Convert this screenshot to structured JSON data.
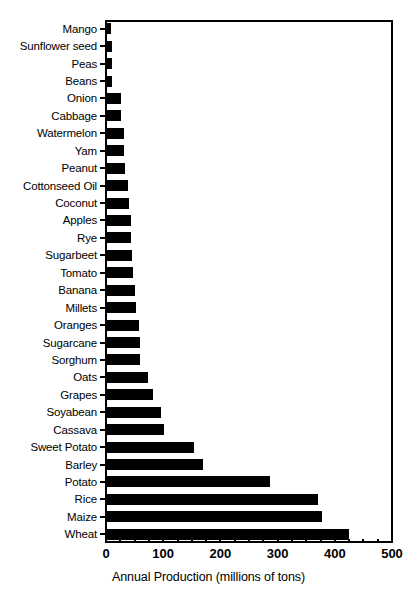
{
  "chart_data": {
    "type": "bar",
    "orientation": "horizontal",
    "title": "",
    "xlabel": "Annual Production (millions of tons)",
    "ylabel": "",
    "xlim": [
      0,
      500
    ],
    "xticks": [
      0,
      100,
      200,
      300,
      400,
      500
    ],
    "xtick_labels": [
      "0",
      "100",
      "200",
      "300",
      "400",
      "500"
    ],
    "minor_tick_step": 25,
    "grid": false,
    "legend": null,
    "bar_color": "#000000",
    "background_color": "#ffffff",
    "categories": [
      "Mango",
      "Sunflower seed",
      "Peas",
      "Beans",
      "Onion",
      "Cabbage",
      "Watermelon",
      "Yam",
      "Peanut",
      "Cottonseed Oil",
      "Coconut",
      "Apples",
      "Rye",
      "Sugarbeet",
      "Tomato",
      "Banana",
      "Millets",
      "Oranges",
      "Sugarcane",
      "Sorghum",
      "Oats",
      "Grapes",
      "Soyabean",
      "Cassava",
      "Sweet Potato",
      "Barley",
      "Potato",
      "Rice",
      "Maize",
      "Wheat"
    ],
    "values": [
      9,
      10,
      11,
      11,
      26,
      27,
      31,
      32,
      34,
      39,
      40,
      43,
      44,
      45,
      48,
      50,
      53,
      58,
      59,
      60,
      73,
      82,
      96,
      101,
      153,
      169,
      287,
      370,
      377,
      425
    ]
  }
}
